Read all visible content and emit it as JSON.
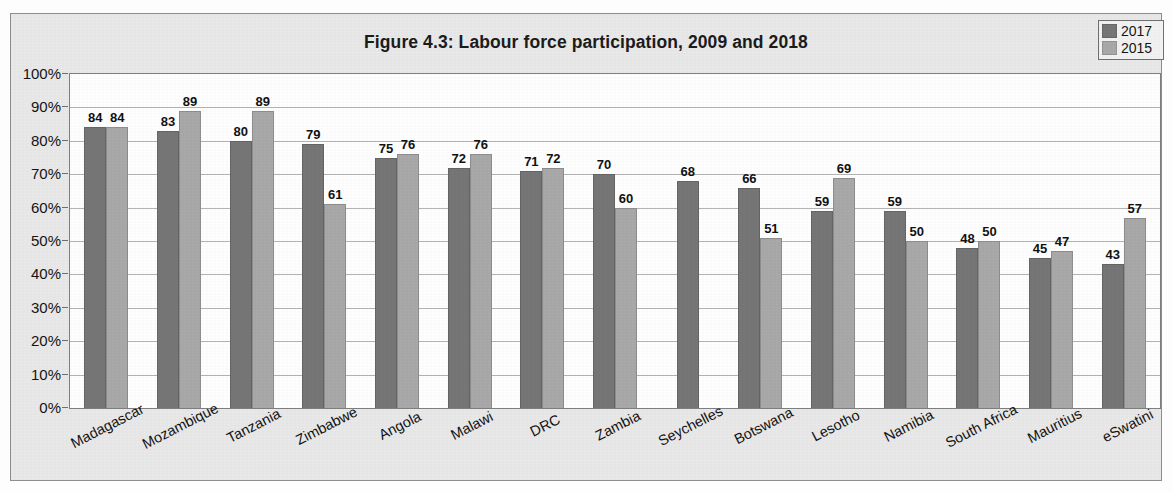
{
  "figure": {
    "title": "Figure 4.3: Labour force participation, 2009 and 2018",
    "background_color": "#e9e9e9",
    "plot_background_color": "#ffffff"
  },
  "legend": {
    "position": "top-right",
    "entries": [
      {
        "label": "2017",
        "color": "#767676"
      },
      {
        "label": "2015",
        "color": "#a9a9a9"
      }
    ]
  },
  "axes": {
    "y_ticks": [
      "100%",
      "90%",
      "80%",
      "70%",
      "60%",
      "50%",
      "40%",
      "30%",
      "20%",
      "10%",
      "0%"
    ],
    "y_min": 0,
    "y_max": 100
  },
  "chart_data": {
    "type": "bar",
    "title": "Figure 4.3: Labour force participation, 2009 and 2018",
    "xlabel": "",
    "ylabel": "",
    "ylim": [
      0,
      100
    ],
    "grid": true,
    "legend_position": "top-right",
    "categories": [
      "Madagascar",
      "Mozambique",
      "Tanzania",
      "Zimbabwe",
      "Angola",
      "Malawi",
      "DRC",
      "Zambia",
      "Seychelles",
      "Botswana",
      "Lesotho",
      "Namibia",
      "South Africa",
      "Mauritius",
      "eSwatini"
    ],
    "series": [
      {
        "name": "2017",
        "color": "#767676",
        "values": [
          84,
          83,
          80,
          79,
          75,
          72,
          71,
          70,
          68,
          66,
          59,
          59,
          48,
          45,
          43
        ]
      },
      {
        "name": "2015",
        "color": "#a9a9a9",
        "values": [
          84,
          89,
          89,
          61,
          76,
          76,
          72,
          60,
          null,
          51,
          69,
          50,
          50,
          47,
          57
        ]
      }
    ]
  }
}
